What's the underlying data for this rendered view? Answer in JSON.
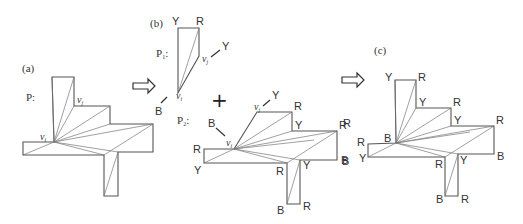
{
  "panels": {
    "a": {
      "label": "(a)",
      "polygon_label": "P:",
      "vertex_labels": {
        "vi": "v",
        "vi_sub": "i",
        "vj": "v",
        "vj_sub": "j"
      },
      "outline": [
        [
          52,
          77
        ],
        [
          74,
          77
        ],
        [
          74,
          106
        ],
        [
          110,
          106
        ],
        [
          110,
          124
        ],
        [
          153,
          124
        ],
        [
          153,
          152
        ],
        [
          118,
          152
        ],
        [
          118,
          196
        ],
        [
          104,
          196
        ],
        [
          104,
          155
        ],
        [
          23,
          155
        ],
        [
          23,
          142
        ],
        [
          54,
          142
        ]
      ],
      "diagonals": [
        [
          [
            54,
            142
          ],
          [
            74,
            77
          ]
        ],
        [
          [
            54,
            142
          ],
          [
            74,
            106
          ]
        ],
        [
          [
            54,
            142
          ],
          [
            110,
            106
          ]
        ],
        [
          [
            54,
            142
          ],
          [
            110,
            124
          ]
        ],
        [
          [
            54,
            142
          ],
          [
            153,
            124
          ]
        ],
        [
          [
            54,
            142
          ],
          [
            118,
            152
          ]
        ],
        [
          [
            54,
            142
          ],
          [
            104,
            155
          ]
        ],
        [
          [
            23,
            155
          ],
          [
            54,
            142
          ]
        ],
        [
          [
            104,
            155
          ],
          [
            153,
            124
          ]
        ],
        [
          [
            104,
            196
          ],
          [
            118,
            152
          ]
        ]
      ]
    },
    "b": {
      "label": "(b)",
      "p1_label": "P",
      "p1_sub": "1",
      "p1_colon": ":",
      "p2_label": "P",
      "p2_sub": "2",
      "p2_colon": ":",
      "plus": "+",
      "p1_vertices": {
        "top_left": "Y",
        "top_right": "R",
        "vj_arrow": "Y",
        "vi_arrow": "B"
      },
      "p2_vertices": {
        "vj_arrow": "Y",
        "vi_arrow": "B",
        "top_right": "R",
        "step": "Y",
        "right_top": "R",
        "right_bottom": "B",
        "inner": "Y",
        "corner": "R",
        "bottom_right": "R",
        "bottom_left": "B",
        "left_top": "R",
        "left_bottom": "Y"
      }
    },
    "c": {
      "label": "(c)",
      "vertex_colors": [
        "Y",
        "R",
        "Y",
        "R",
        "Y",
        "R",
        "B",
        "Y",
        "R",
        "B",
        "R",
        "Y",
        "R",
        "B"
      ]
    }
  },
  "arrows": [
    {
      "name": "arrow-a-to-b",
      "x": 133,
      "y": 80
    },
    {
      "name": "arrow-b-to-c",
      "x": 342,
      "y": 78
    }
  ]
}
